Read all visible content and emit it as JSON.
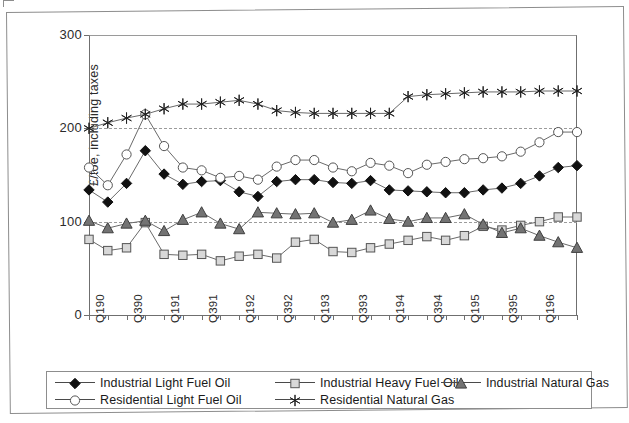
{
  "chart_data": {
    "type": "line",
    "title": "",
    "xlabel": "",
    "ylabel": "£/toe, including taxes",
    "ylim": [
      0,
      300
    ],
    "yticks": [
      0,
      100,
      200,
      300
    ],
    "gridlines": [
      100,
      200
    ],
    "grid": "dashed horizontal reference lines at 100 and 200",
    "legend_position": "bottom",
    "x": [
      "Q190",
      "Q290",
      "Q390",
      "Q490",
      "Q191",
      "Q291",
      "Q391",
      "Q491",
      "Q192",
      "Q292",
      "Q392",
      "Q492",
      "Q193",
      "Q293",
      "Q393",
      "Q493",
      "Q194",
      "Q294",
      "Q394",
      "Q494",
      "Q195",
      "Q295",
      "Q395",
      "Q495",
      "Q196",
      "Q296",
      "Q396"
    ],
    "xtick_labels": [
      "Q190",
      "",
      "Q390",
      "",
      "Q191",
      "",
      "Q391",
      "",
      "Q192",
      "",
      "Q392",
      "",
      "Q193",
      "",
      "Q393",
      "",
      "Q194",
      "",
      "Q394",
      "",
      "Q195",
      "",
      "Q395",
      "",
      "Q196",
      "",
      ""
    ],
    "xtick_labels_rotation": 90,
    "series": [
      {
        "name": "Industrial Light Fuel Oil",
        "marker": "filled-diamond",
        "color": "#111111",
        "values": [
          134,
          121,
          141,
          176,
          151,
          140,
          143,
          144,
          132,
          127,
          143,
          145,
          145,
          142,
          141,
          144,
          134,
          133,
          132,
          131,
          131,
          134,
          136,
          141,
          149,
          158,
          160
        ]
      },
      {
        "name": "Industrial Heavy Fuel Oil",
        "marker": "open-square",
        "color": "#cfcfcf",
        "values": [
          81,
          69,
          72,
          99,
          65,
          64,
          65,
          58,
          63,
          65,
          61,
          78,
          81,
          68,
          67,
          72,
          76,
          80,
          84,
          80,
          85,
          95,
          91,
          96,
          100,
          105,
          105
        ]
      },
      {
        "name": "Industrial Natural Gas",
        "marker": "filled-triangle",
        "color": "#777777",
        "values": [
          101,
          93,
          98,
          101,
          90,
          102,
          110,
          98,
          92,
          110,
          109,
          108,
          109,
          99,
          102,
          112,
          103,
          100,
          104,
          104,
          108,
          97,
          88,
          93,
          85,
          78,
          72
        ]
      },
      {
        "name": "Residential Light Fuel Oil",
        "marker": "open-circle",
        "color": "#ffffff",
        "values": [
          158,
          139,
          172,
          215,
          181,
          158,
          155,
          147,
          149,
          145,
          159,
          166,
          166,
          158,
          154,
          163,
          160,
          152,
          161,
          164,
          167,
          168,
          170,
          175,
          185,
          196,
          196
        ]
      },
      {
        "name": "Residential Natural Gas",
        "marker": "star",
        "color": "#222222",
        "values": [
          200,
          206,
          211,
          215,
          221,
          226,
          226,
          228,
          230,
          226,
          219,
          217,
          216,
          216,
          216,
          216,
          216,
          234,
          236,
          237,
          238,
          239,
          239,
          239,
          240,
          240,
          240
        ]
      }
    ]
  },
  "legend": {
    "entries": [
      {
        "label": "Industrial Light Fuel Oil",
        "marker": "filled-diamond"
      },
      {
        "label": "Industrial Heavy Fuel Oil",
        "marker": "open-square"
      },
      {
        "label": "Industrial Natural Gas",
        "marker": "filled-triangle"
      },
      {
        "label": "Residential Light Fuel Oil",
        "marker": "open-circle"
      },
      {
        "label": "Residential Natural Gas",
        "marker": "star"
      }
    ]
  },
  "axes": {
    "y_axis_title": "£/toe, including taxes",
    "y_tick_0": "0",
    "y_tick_100": "100",
    "y_tick_200": "200",
    "y_tick_300": "300"
  }
}
